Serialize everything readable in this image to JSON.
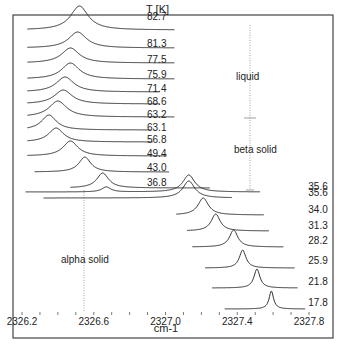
{
  "chart_data": {
    "type": "line",
    "title": "",
    "xlabel": "cm-1",
    "ylabel": "",
    "legend_title": "T [K]",
    "xlim": [
      2326.15,
      2327.85
    ],
    "x_ticks": [
      "2326.2",
      "2326.6",
      "2327.0",
      "2327.4",
      "2327.8"
    ],
    "x_tick_values": [
      2326.2,
      2326.6,
      2327.0,
      2327.4,
      2327.8
    ],
    "minor_tick_step": 0.1,
    "annotations": [
      "liquid",
      "beta solid",
      "alpha solid"
    ],
    "series": [
      {
        "name": "82.7",
        "peak": 2326.52,
        "x0": 2326.23,
        "x1": 2327.05,
        "base_y": 30,
        "peak_y": 6,
        "width": 0.06,
        "label_y": 20
      },
      {
        "name": "81.3",
        "peak": 2326.51,
        "x0": 2326.23,
        "x1": 2327.05,
        "base_y": 48,
        "peak_y": 32,
        "width": 0.06,
        "label_y": 47
      },
      {
        "name": "77.5",
        "peak": 2326.47,
        "x0": 2326.23,
        "x1": 2327.05,
        "base_y": 63,
        "peak_y": 48,
        "width": 0.06,
        "label_y": 63
      },
      {
        "name": "75.9",
        "peak": 2326.47,
        "x0": 2326.23,
        "x1": 2327.05,
        "base_y": 79,
        "peak_y": 63,
        "width": 0.06,
        "label_y": 78
      },
      {
        "name": "71.4",
        "peak": 2326.44,
        "x0": 2326.23,
        "x1": 2326.97,
        "base_y": 92,
        "peak_y": 77,
        "width": 0.06,
        "label_y": 92
      },
      {
        "name": "68.6",
        "peak": 2326.43,
        "x0": 2326.23,
        "x1": 2326.97,
        "base_y": 104,
        "peak_y": 90,
        "width": 0.06,
        "label_y": 105
      },
      {
        "name": "63.2",
        "peak": 2326.4,
        "x0": 2326.23,
        "x1": 2327.05,
        "base_y": 117,
        "peak_y": 101,
        "width": 0.06,
        "label_y": 118
      },
      {
        "name": "63.1",
        "peak": 2326.35,
        "x0": 2326.23,
        "x1": 2326.92,
        "base_y": 130,
        "peak_y": 115,
        "width": 0.05,
        "label_y": 131
      },
      {
        "name": "56.8",
        "peak": 2326.39,
        "x0": 2326.23,
        "x1": 2326.93,
        "base_y": 142,
        "peak_y": 128,
        "width": 0.05,
        "label_y": 143
      },
      {
        "name": "49.4",
        "peak": 2326.47,
        "x0": 2326.23,
        "x1": 2327.01,
        "base_y": 156,
        "peak_y": 141,
        "width": 0.05,
        "label_y": 157
      },
      {
        "name": "43.0",
        "peak": 2326.55,
        "x0": 2326.27,
        "x1": 2327.02,
        "base_y": 172,
        "peak_y": 157,
        "width": 0.04,
        "label_y": 171
      },
      {
        "name": "36.8",
        "peak": 2326.65,
        "x0": 2326.47,
        "x1": 2327.25,
        "base_y": 188,
        "peak_y": 173,
        "width": 0.04,
        "label_y": 186
      },
      {
        "name": "35.6",
        "peak": 2327.13,
        "x0": 2326.22,
        "x1": 2327.53,
        "base_y": 192,
        "peak_y": 175,
        "width": 0.04,
        "label_y": 190,
        "secondary_peak": 2326.67
      },
      {
        "name": "35.6",
        "peak": 2327.13,
        "x0": 2326.32,
        "x1": 2327.37,
        "base_y": 198,
        "peak_y": 181,
        "width": 0.04,
        "label_y": 196
      },
      {
        "name": "34.0",
        "peak": 2327.21,
        "x0": 2327.06,
        "x1": 2327.55,
        "base_y": 215,
        "peak_y": 198,
        "width": 0.035,
        "label_y": 213
      },
      {
        "name": "31.3",
        "peak": 2327.28,
        "x0": 2327.12,
        "x1": 2327.58,
        "base_y": 231,
        "peak_y": 214,
        "width": 0.03,
        "label_y": 229
      },
      {
        "name": "28.2",
        "peak": 2327.38,
        "x0": 2327.15,
        "x1": 2327.66,
        "base_y": 247,
        "peak_y": 230,
        "width": 0.028,
        "label_y": 244
      },
      {
        "name": "25.9",
        "peak": 2327.43,
        "x0": 2327.22,
        "x1": 2327.72,
        "base_y": 268,
        "peak_y": 250,
        "width": 0.022,
        "label_y": 264
      },
      {
        "name": "21.8",
        "peak": 2327.51,
        "x0": 2327.26,
        "x1": 2327.74,
        "base_y": 288,
        "peak_y": 269,
        "width": 0.02,
        "label_y": 285
      },
      {
        "name": "17.8",
        "peak": 2327.59,
        "x0": 2327.33,
        "x1": 2327.78,
        "base_y": 309,
        "peak_y": 291,
        "width": 0.015,
        "label_y": 306
      }
    ]
  },
  "labels": {
    "legend_title": "T [K]",
    "xlabel": "cm-1",
    "liquid": "liquid",
    "beta_solid": "beta solid",
    "alpha_solid": "alpha solid"
  },
  "colors": {
    "line": "#333333",
    "frame": "#444444",
    "dotted": "#888888"
  }
}
